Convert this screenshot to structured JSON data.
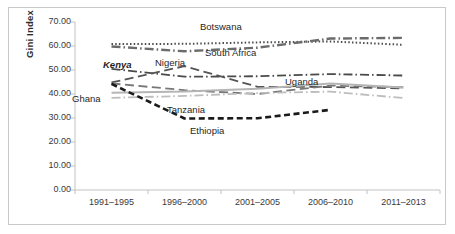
{
  "chart_data": {
    "type": "line",
    "title": "",
    "xlabel": "",
    "ylabel": "Gini Index",
    "ylim": [
      0,
      70
    ],
    "ytick_labels": [
      "70.00",
      "60.00",
      "50.00",
      "40.00",
      "30.00",
      "20.00",
      "10.00",
      "0.00"
    ],
    "ytick_values": [
      70,
      60,
      50,
      40,
      30,
      20,
      10,
      0
    ],
    "grid": false,
    "legend": "inline-labels",
    "categories": [
      "1991–1995",
      "1996–2000",
      "2001–2005",
      "2006–2010",
      "2011–2013"
    ],
    "series": [
      {
        "name": "Botswana",
        "values": [
          60.8,
          60.9,
          61.5,
          61.9,
          60.5
        ],
        "style": "dotted",
        "color": "#4d4d4d",
        "width": 2.0
      },
      {
        "name": "South Africa",
        "values": [
          59.8,
          57.8,
          59.3,
          63.1,
          63.4
        ],
        "style": "dashdot",
        "color": "#6b6b6b",
        "width": 2.4
      },
      {
        "name": "Kenya",
        "values": [
          50.5,
          47.2,
          47.4,
          48.3,
          47.7
        ],
        "style": "dashdot",
        "color": "#4a4a4a",
        "width": 1.8
      },
      {
        "name": "Nigeria",
        "values": [
          44.8,
          51.6,
          43.0,
          42.9,
          42.3
        ],
        "style": "longdash",
        "color": "#555555",
        "width": 1.8
      },
      {
        "name": "Uganda",
        "values": [
          44.4,
          41.6,
          40.0,
          43.5,
          42.8
        ],
        "style": "longdash",
        "color": "#777777",
        "width": 1.8
      },
      {
        "name": "Tanzania",
        "values": [
          40.5,
          41.0,
          42.2,
          44.4,
          42.7
        ],
        "style": "solid",
        "color": "#b5b5b5",
        "width": 2.0
      },
      {
        "name": "Ghana",
        "values": [
          38.4,
          39.2,
          40.4,
          41.0,
          38.3
        ],
        "style": "dashdot",
        "color": "#bdbdbd",
        "width": 1.8
      },
      {
        "name": "Ethiopia",
        "values": [
          44.2,
          29.8,
          29.9,
          33.4,
          null
        ],
        "style": "dashed",
        "color": "#1a1a1a",
        "width": 2.6
      }
    ],
    "annotations": [
      {
        "text": "Botswana",
        "x": 200,
        "y": 21,
        "italic": false
      },
      {
        "text": "South Africa",
        "x": 205,
        "y": 47,
        "italic": false
      },
      {
        "text": "Nigeria",
        "x": 155,
        "y": 57,
        "italic": false
      },
      {
        "text": "Kenya",
        "x": 103,
        "y": 59,
        "italic": true
      },
      {
        "text": "Uganda",
        "x": 285,
        "y": 76,
        "italic": false
      },
      {
        "text": "Ghana",
        "x": 72,
        "y": 93,
        "italic": false
      },
      {
        "text": "Tanzania",
        "x": 167,
        "y": 104,
        "italic": false
      },
      {
        "text": "Ethiopia",
        "x": 190,
        "y": 125,
        "italic": false
      }
    ]
  },
  "axes": {
    "y_axis_x": 75,
    "plot_top": 22,
    "plot_bottom": 190,
    "plot_left": 75,
    "plot_right": 440
  }
}
